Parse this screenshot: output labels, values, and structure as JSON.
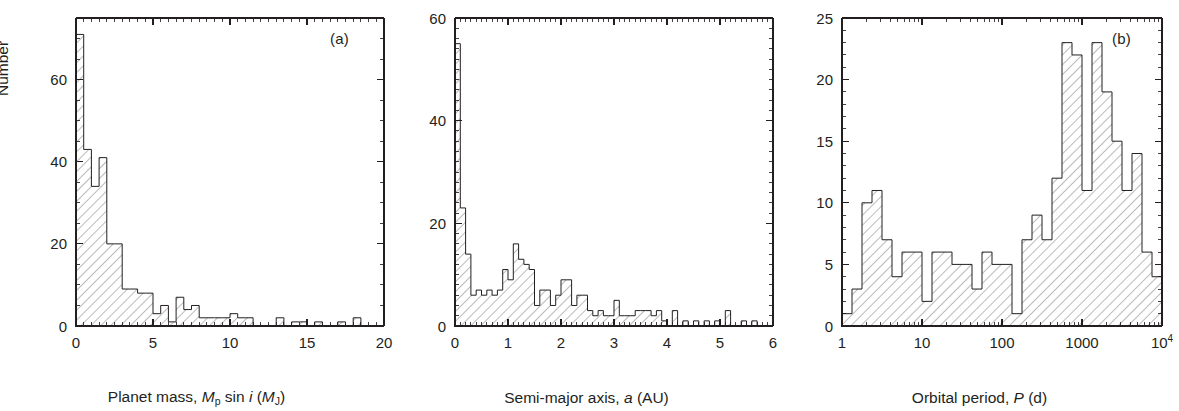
{
  "figure": {
    "type": "multi-panel-histogram-figure",
    "panel_count": 3,
    "background_color": "#ffffff",
    "line_color": "#231f20",
    "hatch_color": "#4a4a4a",
    "shared_ylabel": "Number"
  },
  "panels": {
    "a": {
      "tag": "(a)",
      "ylabel": "Number"
    },
    "b": {
      "tag": "(b)",
      "ylabel": ""
    },
    "c": {
      "tag": "(c)",
      "ylabel": ""
    }
  },
  "chart_data": [
    {
      "id": "a",
      "type": "bar",
      "subtype": "histogram",
      "title": "",
      "panel_label": "(a)",
      "xlabel": "Planet mass, Mp sin i (MJ)",
      "xlabel_parts": [
        "Planet mass, ",
        "M",
        "p",
        " sin ",
        "i",
        " (",
        "M",
        "J",
        ")"
      ],
      "ylabel": "Number",
      "xlim": [
        0,
        20
      ],
      "ylim": [
        0,
        75
      ],
      "xscale": "linear",
      "yscale": "linear",
      "grid": false,
      "legend": "none",
      "xticks_major": [
        0,
        5,
        10,
        15,
        20
      ],
      "xticklabels": [
        "0",
        "5",
        "10",
        "15",
        "20"
      ],
      "xtick_minor_step": 0.5,
      "yticks_major": [
        0,
        20,
        40,
        60
      ],
      "yticklabels": [
        "0",
        "20",
        "40",
        "60"
      ],
      "ytick_minor_step": 5,
      "bin_width": 0.5,
      "bin_starts": [
        0.0,
        0.5,
        1.0,
        1.5,
        2.0,
        2.5,
        3.0,
        3.5,
        4.0,
        4.5,
        5.0,
        5.5,
        6.0,
        6.5,
        7.0,
        7.5,
        8.0,
        8.5,
        9.0,
        9.5,
        10.0,
        10.5,
        11.0,
        11.5,
        12.0,
        12.5,
        13.0,
        13.5,
        14.0,
        14.5,
        15.0,
        15.5,
        16.0,
        16.5,
        17.0,
        17.5,
        18.0,
        18.5,
        19.0,
        19.5
      ],
      "values": [
        71,
        43,
        34,
        41,
        20,
        20,
        9,
        9,
        8,
        8,
        3,
        5,
        1,
        7,
        4,
        5,
        2,
        2,
        2,
        2,
        3,
        2,
        2,
        0,
        0,
        0,
        2,
        0,
        1,
        1,
        0,
        1,
        0,
        0,
        1,
        0,
        2,
        0,
        0,
        0
      ]
    },
    {
      "id": "b",
      "type": "bar",
      "subtype": "histogram",
      "title": "",
      "panel_label": "(b)",
      "xlabel": "Semi-major axis, a (AU)",
      "xlabel_parts": [
        "Semi-major axis, ",
        "a",
        " (AU)"
      ],
      "ylabel": "Number",
      "xlim": [
        0,
        6
      ],
      "ylim": [
        0,
        60
      ],
      "xscale": "linear",
      "yscale": "linear",
      "grid": false,
      "legend": "none",
      "xticks_major": [
        0,
        1,
        2,
        3,
        4,
        5,
        6
      ],
      "xticklabels": [
        "0",
        "1",
        "2",
        "3",
        "4",
        "5",
        "6"
      ],
      "xtick_minor_step": 0.1,
      "yticks_major": [
        0,
        20,
        40,
        60
      ],
      "yticklabels": [
        "0",
        "20",
        "40",
        "60"
      ],
      "ytick_minor_step": 2,
      "bin_width": 0.1,
      "bin_starts": [
        0.0,
        0.1,
        0.2,
        0.3,
        0.4,
        0.5,
        0.6,
        0.7,
        0.8,
        0.9,
        1.0,
        1.1,
        1.2,
        1.3,
        1.4,
        1.5,
        1.6,
        1.7,
        1.8,
        1.9,
        2.0,
        2.1,
        2.2,
        2.3,
        2.4,
        2.5,
        2.6,
        2.7,
        2.8,
        2.9,
        3.0,
        3.1,
        3.2,
        3.3,
        3.4,
        3.5,
        3.6,
        3.7,
        3.8,
        3.9,
        4.0,
        4.1,
        4.2,
        4.3,
        4.4,
        4.5,
        4.6,
        4.7,
        4.8,
        4.9,
        5.0,
        5.1,
        5.2,
        5.3,
        5.4,
        5.5,
        5.6,
        5.7,
        5.8,
        5.9
      ],
      "values": [
        55,
        23,
        14,
        6,
        7,
        6,
        7,
        6,
        7,
        11,
        9,
        16,
        13,
        12,
        11,
        4,
        7,
        7,
        4,
        6,
        9,
        9,
        4,
        6,
        6,
        3,
        2,
        3,
        2,
        2,
        5,
        2,
        2,
        2,
        3,
        3,
        3,
        2,
        3,
        1,
        0,
        3,
        0,
        1,
        0,
        1,
        0,
        1,
        0,
        1,
        0,
        3,
        0,
        0,
        1,
        0,
        1,
        0,
        0,
        0
      ]
    },
    {
      "id": "c",
      "type": "bar",
      "subtype": "histogram",
      "title": "",
      "panel_label": "(c)",
      "xlabel": "Orbital period, P (d)",
      "xlabel_parts": [
        "Orbital period, ",
        "P",
        " (d)"
      ],
      "ylabel": "Number",
      "xlim": [
        1,
        10000
      ],
      "ylim": [
        0,
        25
      ],
      "xscale": "log",
      "yscale": "linear",
      "grid": false,
      "legend": "none",
      "xticks_major": [
        1,
        10,
        100,
        1000,
        10000
      ],
      "xticklabels": [
        "1",
        "10",
        "100",
        "1000",
        "10⁴"
      ],
      "xticklabel_last_base": "10",
      "xticklabel_last_exp": "4",
      "yticks_major": [
        0,
        5,
        10,
        15,
        20,
        25
      ],
      "yticklabels": [
        "0",
        "5",
        "10",
        "15",
        "20",
        "25"
      ],
      "ytick_minor_step": 1,
      "bin_width_dex": 0.125,
      "bin_starts_dex": [
        0.0,
        0.125,
        0.25,
        0.375,
        0.5,
        0.625,
        0.75,
        0.875,
        1.0,
        1.125,
        1.25,
        1.375,
        1.5,
        1.625,
        1.75,
        1.875,
        2.0,
        2.125,
        2.25,
        2.375,
        2.5,
        2.625,
        2.75,
        2.875,
        3.0,
        3.125,
        3.25,
        3.375,
        3.5,
        3.625,
        3.75,
        3.875
      ],
      "values": [
        1,
        3,
        10,
        11,
        7,
        4,
        6,
        6,
        2,
        6,
        6,
        5,
        5,
        3,
        6,
        5,
        5,
        1,
        7,
        9,
        7,
        12,
        23,
        22,
        11,
        23,
        19,
        15,
        11,
        14,
        6,
        4
      ]
    }
  ]
}
